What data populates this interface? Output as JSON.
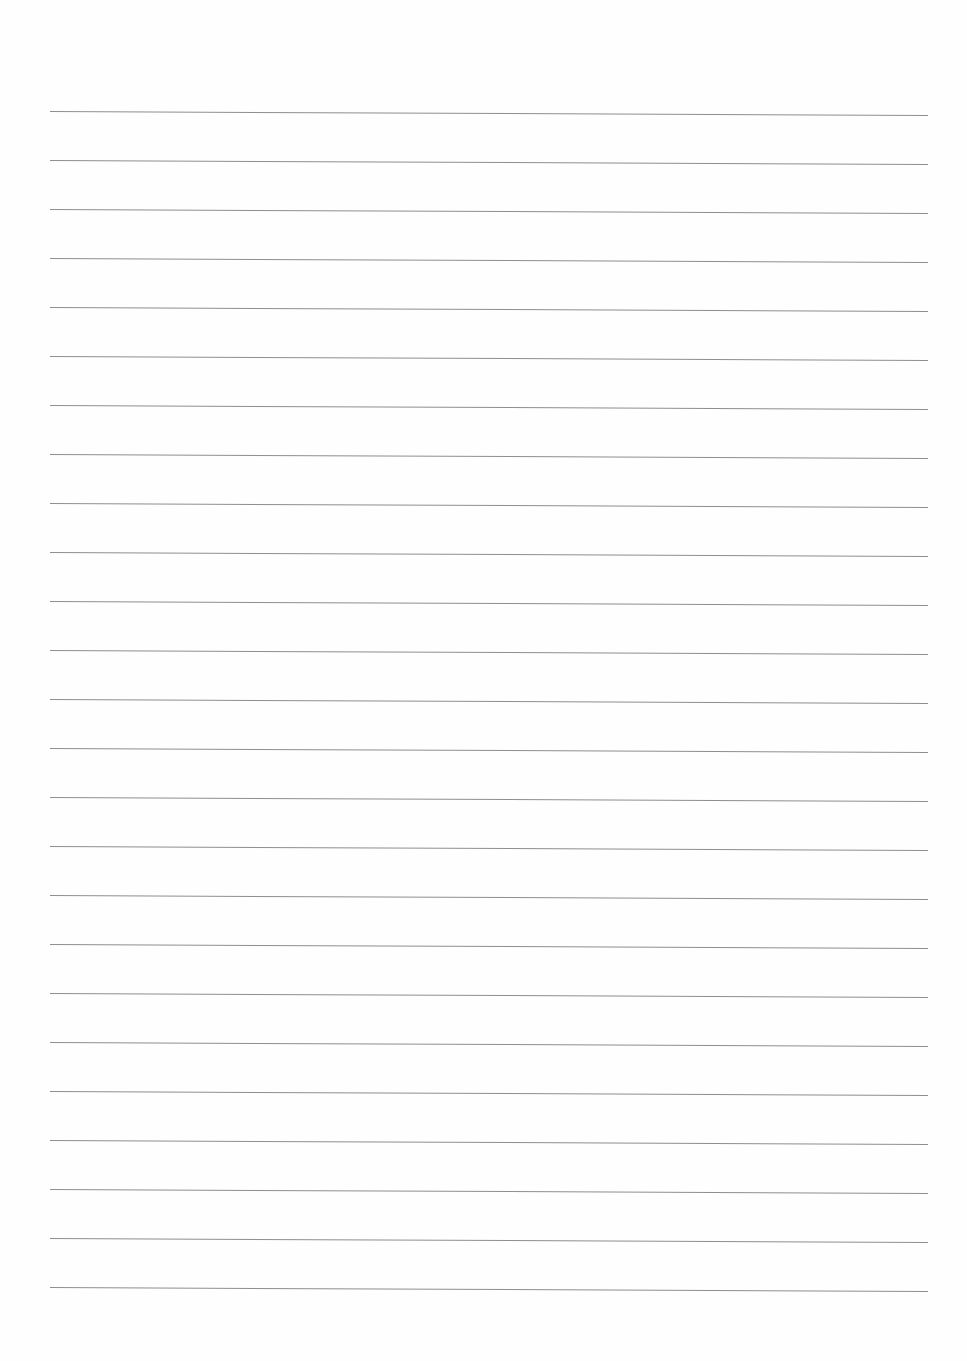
{
  "document": {
    "type": "ruled-paper",
    "background_color": "#fefefe",
    "rule_color": "#7a7a7a",
    "rule_count": 25,
    "rule_left_x": 50,
    "rule_right_x": 928,
    "first_rule_y": 111,
    "rule_spacing": 49,
    "rule_tilt_px": 4,
    "text_content": []
  }
}
